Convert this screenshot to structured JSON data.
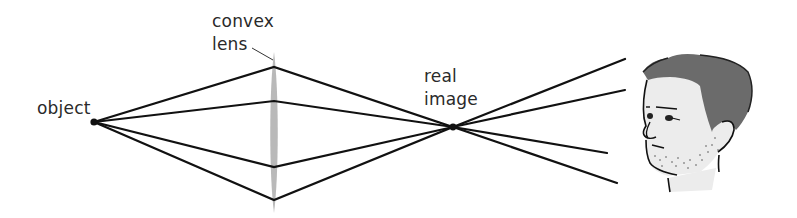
{
  "diagram": {
    "title": "",
    "labels": {
      "object": "object",
      "lens_line1": "convex",
      "lens_line2": "lens",
      "image_line1": "real",
      "image_line2": "image"
    },
    "colors": {
      "ray": "#111111",
      "lens": "#b9b9b9",
      "hair": "#6b6b6b",
      "skin": "#ececec",
      "text": "#2a2a2a"
    },
    "points": {
      "object": [
        94,
        122
      ],
      "real_image": [
        453,
        127
      ],
      "lens_x": 274
    },
    "rays": [
      {
        "lens_hit": [
          274,
          67
        ],
        "end": [
          625,
          59
        ]
      },
      {
        "lens_hit": [
          274,
          101
        ],
        "end": [
          625,
          90
        ]
      },
      {
        "lens_hit": [
          274,
          167
        ],
        "end": [
          607,
          153
        ]
      },
      {
        "lens_hit": [
          274,
          200
        ],
        "end": [
          617,
          183
        ]
      }
    ],
    "viewer": "eye-observer-face"
  }
}
